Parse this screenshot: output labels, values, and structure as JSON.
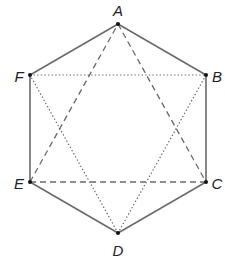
{
  "diagram": {
    "colors": {
      "background": "#ffffff",
      "line": "#6a6a6a",
      "point": "#111111",
      "label": "#222222"
    },
    "vertices": [
      {
        "id": "A",
        "label": "A",
        "x": 118,
        "y": 24,
        "label_x": 118,
        "label_y": 10
      },
      {
        "id": "B",
        "label": "B",
        "x": 206,
        "y": 75,
        "label_x": 217,
        "label_y": 76
      },
      {
        "id": "C",
        "label": "C",
        "x": 206,
        "y": 182,
        "label_x": 217,
        "label_y": 183
      },
      {
        "id": "D",
        "label": "D",
        "x": 118,
        "y": 233,
        "label_x": 118,
        "label_y": 250
      },
      {
        "id": "E",
        "label": "E",
        "x": 30,
        "y": 182,
        "label_x": 19,
        "label_y": 183
      },
      {
        "id": "F",
        "label": "F",
        "x": 30,
        "y": 75,
        "label_x": 19,
        "label_y": 76
      }
    ],
    "segments": [
      {
        "from": "A",
        "to": "B",
        "style": "solid"
      },
      {
        "from": "B",
        "to": "C",
        "style": "solid"
      },
      {
        "from": "C",
        "to": "D",
        "style": "solid"
      },
      {
        "from": "D",
        "to": "E",
        "style": "solid"
      },
      {
        "from": "E",
        "to": "F",
        "style": "solid"
      },
      {
        "from": "F",
        "to": "A",
        "style": "solid"
      },
      {
        "from": "A",
        "to": "C",
        "style": "dashed"
      },
      {
        "from": "C",
        "to": "E",
        "style": "dashed"
      },
      {
        "from": "E",
        "to": "A",
        "style": "dashed"
      },
      {
        "from": "B",
        "to": "D",
        "style": "dotted"
      },
      {
        "from": "D",
        "to": "F",
        "style": "dotted"
      },
      {
        "from": "F",
        "to": "B",
        "style": "dotted"
      }
    ]
  }
}
